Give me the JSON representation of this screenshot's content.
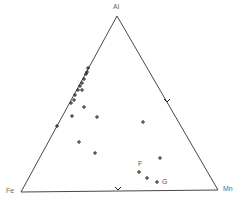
{
  "chart_data": {
    "type": "ternary-scatter",
    "title": "",
    "vertices": {
      "top": {
        "label": "Al",
        "x": 117,
        "y": 16
      },
      "left": {
        "label": "Fe",
        "x": 21,
        "y": 192
      },
      "right": {
        "label": "Mn",
        "x": 218,
        "y": 190
      }
    },
    "marker": "+",
    "points_px": [
      [
        88,
        68
      ],
      [
        87,
        72
      ],
      [
        86,
        74
      ],
      [
        84,
        79
      ],
      [
        82,
        83
      ],
      [
        80,
        86
      ],
      [
        78,
        90
      ],
      [
        75,
        95
      ],
      [
        74,
        100
      ],
      [
        71,
        103
      ],
      [
        57,
        126
      ],
      [
        82,
        90
      ],
      [
        84,
        107
      ],
      [
        72,
        116
      ],
      [
        97,
        117
      ],
      [
        143,
        122
      ],
      [
        79,
        142
      ],
      [
        95,
        153
      ],
      [
        160,
        158
      ],
      [
        139,
        172
      ],
      [
        147,
        178
      ],
      [
        157,
        182
      ]
    ],
    "edge_ticks_px": [
      [
        167,
        102
      ],
      [
        118,
        190
      ]
    ],
    "annotations": [
      {
        "text": "F",
        "x": 138,
        "y": 161
      },
      {
        "text": "G",
        "x": 162,
        "y": 179
      }
    ],
    "colors": {
      "line": "#333333",
      "marker": "#222222",
      "label": "#6a6a6a"
    }
  },
  "labels": {
    "al": "Al",
    "fe": "Fe",
    "mn": "Mn",
    "f": "F",
    "g": "G"
  }
}
